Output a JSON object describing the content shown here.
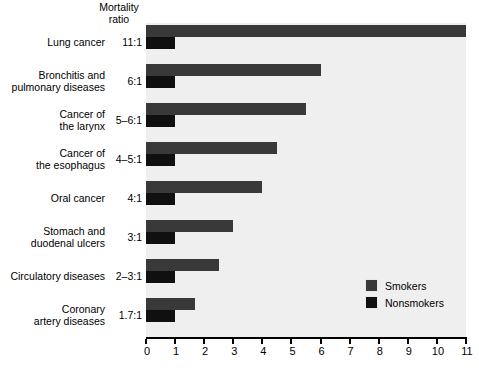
{
  "chart_data": {
    "type": "bar",
    "orientation": "horizontal",
    "title": "",
    "header_label": "Mortality\nratio",
    "header_line1": "Mortality",
    "header_line2": "ratio",
    "xlabel": "",
    "ylabel": "",
    "xlim": [
      0,
      11
    ],
    "xticks": [
      0,
      1,
      2,
      3,
      4,
      5,
      6,
      7,
      8,
      9,
      10,
      11
    ],
    "xtick_labels": [
      "0",
      "1",
      "2",
      "3",
      "4",
      "5",
      "6",
      "7",
      "8",
      "9",
      "10",
      "11"
    ],
    "grid": false,
    "legend_position": "inside-lower-right",
    "plot_background": "#efefef",
    "categories": [
      "Lung cancer",
      "Bronchitis and\npulmonary diseases",
      "Cancer of\nthe larynx",
      "Cancer of\nthe esophagus",
      "Oral cancer",
      "Stomach and\nduodenal ulcers",
      "Circulatory diseases",
      "Coronary\nartery diseases"
    ],
    "ratio_labels": [
      "11:1",
      "6:1",
      "5–6:1",
      "4–5:1",
      "4:1",
      "3:1",
      "2–3:1",
      "1.7:1"
    ],
    "series": [
      {
        "name": "Smokers",
        "color": "#393939",
        "values": [
          11.0,
          6.0,
          5.5,
          4.5,
          4.0,
          3.0,
          2.5,
          1.7
        ]
      },
      {
        "name": "Nonsmokers",
        "color": "#101010",
        "values": [
          1.0,
          1.0,
          1.0,
          1.0,
          1.0,
          1.0,
          1.0,
          1.0
        ]
      }
    ]
  },
  "legend": {
    "items": [
      {
        "label": "Smokers",
        "color": "#393939"
      },
      {
        "label": "Nonsmokers",
        "color": "#101010"
      }
    ]
  }
}
